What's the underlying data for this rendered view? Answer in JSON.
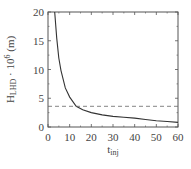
{
  "chart_data": {
    "type": "line",
    "title": "",
    "xlabel": "t_inj",
    "xlabel_main": "t",
    "xlabel_sub": "inj",
    "ylabel": "H_LHD · 10^6 (m)",
    "ylabel_main": "H",
    "ylabel_sub": "LHD",
    "ylabel_rest": " · 10",
    "ylabel_sup": "6",
    "ylabel_unit": " (m)",
    "xlim": [
      0,
      60
    ],
    "ylim": [
      0,
      20
    ],
    "xticks": [
      0,
      10,
      20,
      30,
      40,
      50,
      60
    ],
    "yticks": [
      0,
      5,
      10,
      15,
      20
    ],
    "grid": false,
    "series": [
      {
        "name": "H_LHD",
        "style": "solid",
        "color": "#333333",
        "x": [
          3.1,
          4,
          5,
          6,
          8,
          10,
          13,
          16,
          20,
          25,
          30,
          35,
          40,
          45,
          50,
          55,
          60
        ],
        "y": [
          20,
          15.5,
          12.0,
          9.8,
          6.8,
          5.2,
          3.6,
          3.0,
          2.5,
          2.1,
          1.85,
          1.7,
          1.55,
          1.3,
          1.1,
          0.95,
          0.8
        ]
      },
      {
        "name": "threshold",
        "style": "dashed",
        "color": "#666666",
        "x": [
          0,
          60
        ],
        "y": [
          3.6,
          3.6
        ]
      }
    ]
  }
}
